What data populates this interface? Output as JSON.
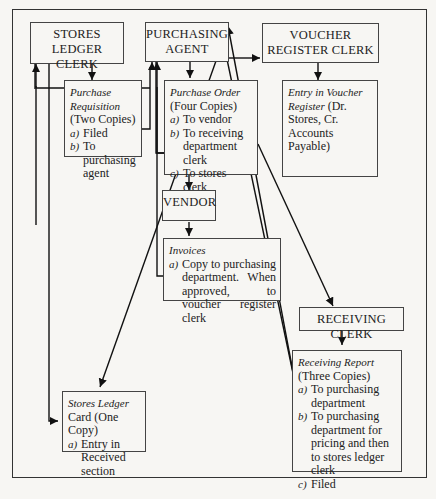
{
  "diagram": {
    "nodes": {
      "stores_ledger_clerk": {
        "label": "STORES LEDGER CLERK"
      },
      "purchasing_agent": {
        "label": "PURCHASING AGENT"
      },
      "voucher_register_clerk": {
        "label": "VOUCHER REGISTER CLERK"
      },
      "vendor": {
        "label": "VENDOR"
      },
      "receiving_clerk": {
        "label": "RECEIVING CLERK"
      }
    },
    "documents": {
      "purchase_requisition": {
        "title_italic": "Purchase Requisition",
        "title_rest": " (Two Copies)",
        "items": [
          {
            "letter": "a)",
            "text": "Filed"
          },
          {
            "letter": "b)",
            "text": "To purchasing agent"
          }
        ]
      },
      "purchase_order": {
        "title_italic": "Purchase Order",
        "title_rest": " (Four Copies)",
        "items": [
          {
            "letter": "a)",
            "text": "To vendor"
          },
          {
            "letter": "b)",
            "text": "To receiving department clerk"
          },
          {
            "letter": "c)",
            "text": "To stores clerk"
          },
          {
            "letter": "d)",
            "text": "Filed"
          }
        ]
      },
      "voucher_entry": {
        "title_italic": "Entry in Voucher Register",
        "title_rest": " (Dr. Stores, Cr. Accounts Payable)"
      },
      "invoices": {
        "title_italic": "Invoices",
        "items": [
          {
            "letter": "a)",
            "text": "Copy to purchasing department. When approved, to voucher register clerk"
          }
        ]
      },
      "receiving_report": {
        "title_italic": "Receiving Report",
        "title_rest": " (Three Copies)",
        "items": [
          {
            "letter": "a)",
            "text": "To purchasing department"
          },
          {
            "letter": "b)",
            "text": "To purchasing department for pricing and then to stores ledger clerk"
          },
          {
            "letter": "c)",
            "text": "Filed"
          }
        ]
      },
      "stores_ledger_card": {
        "title_italic": "Stores Ledger",
        "title_rest": " Card (One Copy)",
        "items": [
          {
            "letter": "a)",
            "text": "Entry in Received section"
          }
        ]
      }
    },
    "edges": [
      {
        "from": "stores_ledger_clerk",
        "to": "purchase_requisition"
      },
      {
        "from": "purchase_requisition",
        "to": "purchasing_agent"
      },
      {
        "from": "purchasing_agent",
        "to": "purchase_order"
      },
      {
        "from": "purchasing_agent",
        "to": "voucher_register_clerk",
        "style": "dashed-then-solid"
      },
      {
        "from": "voucher_register_clerk",
        "to": "voucher_entry"
      },
      {
        "from": "purchase_order",
        "to": "vendor"
      },
      {
        "from": "purchase_order",
        "to": "stores_ledger_clerk"
      },
      {
        "from": "purchase_order",
        "to": "receiving_clerk"
      },
      {
        "from": "vendor",
        "to": "invoices"
      },
      {
        "from": "invoices",
        "to": "purchasing_agent"
      },
      {
        "from": "purchasing_agent",
        "to": "stores_ledger_card"
      },
      {
        "from": "receiving_clerk",
        "to": "receiving_report"
      },
      {
        "from": "receiving_report",
        "to": "purchasing_agent"
      },
      {
        "from": "stores_ledger_clerk",
        "to": "stores_ledger_card"
      }
    ]
  }
}
